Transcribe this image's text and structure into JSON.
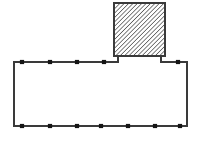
{
  "canvas": {
    "width": 201,
    "height": 146,
    "background_color": "#ffffff",
    "title": "floor-plan-outline-diagram"
  },
  "style": {
    "outline_color": "#3a3a3a",
    "outline_width": 2,
    "hatch_line_color": "#1a1a1a",
    "hatch_line_width": 1.1,
    "hatch_spacing": 3.1,
    "hatch_angle_deg": 45,
    "hatch_fill_background": "#ffffff",
    "tick_color": "#151515",
    "tick_width": 4.2,
    "tick_height": 4.2
  },
  "shapes": {
    "main_room": {
      "name": "main-rectangle",
      "label": "main room outline",
      "x": 14,
      "y": 62,
      "width": 173,
      "height": 64,
      "right": 187,
      "bottom": 126,
      "fill": "none"
    },
    "hatched_block": {
      "name": "hatched-square",
      "label": "hatched square block",
      "x": 114,
      "y": 3,
      "width": 51,
      "height": 53,
      "right": 165,
      "bottom": 56,
      "fill": "diagonal-hatch"
    },
    "connectors": [
      {
        "name": "left-connector",
        "x": 118,
        "y_top": 56,
        "y_bottom": 62
      },
      {
        "name": "right-connector",
        "x": 161,
        "y_top": 56,
        "y_bottom": 62
      }
    ],
    "outline_path": "M 14 126 L 14 62 L 118 62 L 118 56 L 161 56 L 161 62 L 187 62 L 187 126 Z"
  },
  "ticks": {
    "top_edge": {
      "name": "top-edge-ticks",
      "y": 62,
      "positions_x": [
        22,
        50,
        77,
        104,
        178
      ],
      "count": 5
    },
    "bottom_edge": {
      "name": "bottom-edge-ticks",
      "y": 126,
      "positions_x": [
        22,
        50,
        77,
        101,
        128,
        155,
        180
      ],
      "count": 7
    }
  }
}
